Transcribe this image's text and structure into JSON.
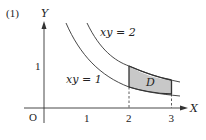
{
  "problem": {
    "number_label": "(1)"
  },
  "axes": {
    "x_label": "X",
    "y_label": "Y",
    "origin_label": "O",
    "x_ticks": [
      "1",
      "2",
      "3"
    ],
    "y_ticks": [
      "1"
    ]
  },
  "curves": [
    {
      "label": "xy = 2",
      "equation": "y = 2/x"
    },
    {
      "label": "xy = 1",
      "equation": "y = 1/x"
    }
  ],
  "region": {
    "label": "D",
    "fill": "#c8c8c8",
    "description": "Region between y=1/x and y=2/x for 2 ≤ x ≤ 3"
  },
  "colors": {
    "line": "#333333",
    "region_fill": "#c8c8c8"
  }
}
